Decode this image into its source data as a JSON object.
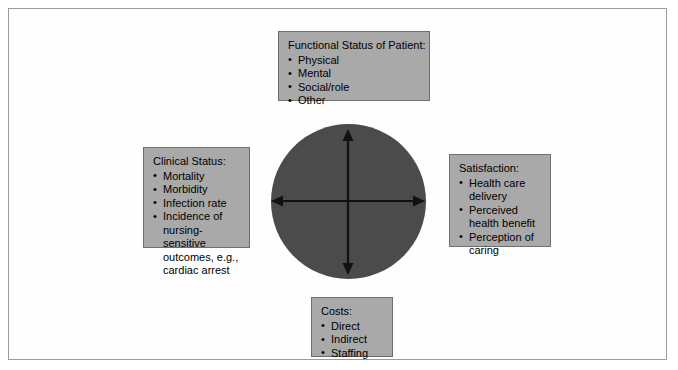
{
  "diagram": {
    "center": {
      "shape": "filled-circle",
      "fill_color": "#4b4b4b",
      "arrows": "four-way double-headed cross"
    },
    "frame": {
      "border_color": "#9b9b9b",
      "background": "#ffffff"
    },
    "box_style": {
      "fill_color": "#a9a9a9",
      "border_color": "#6e6e6e",
      "text_color": "#000000"
    },
    "boxes": [
      {
        "id": "functional-status",
        "position": "top",
        "title": "Functional Status of Patient:",
        "items": [
          "Physical",
          "Mental",
          "Social/role",
          "Other"
        ]
      },
      {
        "id": "clinical-status",
        "position": "left",
        "title": "Clinical Status:",
        "items": [
          "Mortality",
          "Morbidity",
          "Infection rate",
          "Incidence of\nnursing-sensitive\noutcomes, e.g.,\ncardiac arrest"
        ]
      },
      {
        "id": "satisfaction",
        "position": "right",
        "title": "Satisfaction:",
        "items": [
          "Health care\ndelivery",
          "Perceived\nhealth benefit",
          "Perception of\ncaring"
        ]
      },
      {
        "id": "costs",
        "position": "bottom",
        "title": "Costs:",
        "items": [
          "Direct",
          "Indirect",
          "Staffing"
        ]
      }
    ],
    "bullet_glyph": "•"
  }
}
